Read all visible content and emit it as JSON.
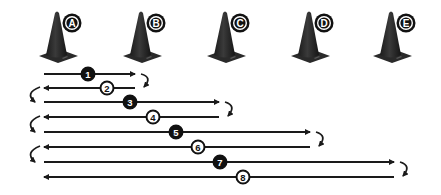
{
  "diagram": {
    "type": "shuttle-run-drill",
    "colors": {
      "cone": "#2a2a2a",
      "cone_highlight": "#555555",
      "line": "#1a1a1a",
      "badge_fill_dark": "#111111",
      "badge_fill_light": "#ffffff",
      "background": "#ffffff"
    },
    "cones": [
      {
        "label": "A",
        "x": 57
      },
      {
        "label": "B",
        "x": 141
      },
      {
        "label": "C",
        "x": 225
      },
      {
        "label": "D",
        "x": 309
      },
      {
        "label": "E",
        "x": 391
      }
    ],
    "runs": [
      {
        "number": "1",
        "direction": "right",
        "y": 74,
        "x_start": 44,
        "x_end": 135,
        "badge_x": 88,
        "badge_style": "filled",
        "turn": "right"
      },
      {
        "number": "2",
        "direction": "left",
        "y": 88,
        "x_start": 44,
        "x_end": 135,
        "badge_x": 107,
        "badge_style": "outlined",
        "turn": "left"
      },
      {
        "number": "3",
        "direction": "right",
        "y": 102,
        "x_start": 44,
        "x_end": 219,
        "badge_x": 130,
        "badge_style": "filled",
        "turn": "right"
      },
      {
        "number": "4",
        "direction": "left",
        "y": 117,
        "x_start": 44,
        "x_end": 219,
        "badge_x": 153,
        "badge_style": "outlined",
        "turn": "left"
      },
      {
        "number": "5",
        "direction": "right",
        "y": 132,
        "x_start": 44,
        "x_end": 310,
        "badge_x": 176,
        "badge_style": "filled",
        "turn": "right"
      },
      {
        "number": "6",
        "direction": "left",
        "y": 147,
        "x_start": 44,
        "x_end": 310,
        "badge_x": 198,
        "badge_style": "outlined",
        "turn": "left"
      },
      {
        "number": "7",
        "direction": "right",
        "y": 162,
        "x_start": 44,
        "x_end": 394,
        "badge_x": 220,
        "badge_style": "filled",
        "turn": "right"
      },
      {
        "number": "8",
        "direction": "left",
        "y": 177,
        "x_start": 44,
        "x_end": 394,
        "badge_x": 243,
        "badge_style": "outlined",
        "turn": null
      }
    ]
  }
}
